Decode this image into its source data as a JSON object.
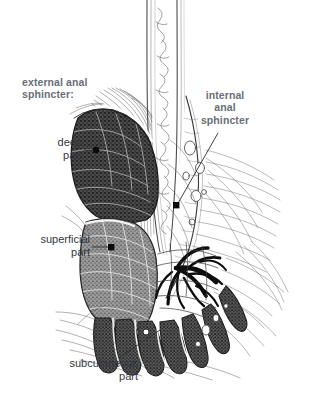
{
  "figure": {
    "background_color": "#ffffff",
    "label_heading_color": "#6b6f78",
    "label_part_color": "#333740",
    "ink_color": "#2b2b2b"
  },
  "labels": {
    "external_anal_sphincter": "external anal\nsphincter:",
    "internal_anal_sphincter": "internal\nanal\nsphincter",
    "deep_part": "deep\npart",
    "superficial_part": "superficial\npart",
    "subcutaneous_part": "subcutaneous\npart"
  },
  "structures": [
    {
      "name": "deep-part-mass",
      "label": "deep part",
      "fill": "#4a4a4a"
    },
    {
      "name": "superficial-part-mass",
      "label": "superficial part",
      "fill": "#8a8a8a"
    },
    {
      "name": "subcutaneous-part-segments",
      "label": "subcutaneous part",
      "fill": "#4f4f4f",
      "count": 7
    },
    {
      "name": "internal-anal-sphincter-band",
      "label": "internal anal sphincter",
      "fill": "#ffffff"
    },
    {
      "name": "hemorrhoidal-plexus",
      "label": "venous plexus",
      "fill": "#111111"
    },
    {
      "name": "rectal-mucosa-column",
      "label": "rectal mucosa",
      "fill": "#ffffff"
    },
    {
      "name": "levator-ani-fibers",
      "label": "levator ani",
      "fill": "none"
    },
    {
      "name": "perianal-tissue-hatching",
      "label": "perianal tissue",
      "fill": "none"
    }
  ],
  "markers": [
    {
      "name": "deep-part-marker",
      "shape": "circle",
      "x": 95,
      "y": 151
    },
    {
      "name": "superficial-part-marker",
      "shape": "square",
      "x": 111,
      "y": 248
    },
    {
      "name": "internal-sphincter-marker",
      "shape": "square",
      "x": 176,
      "y": 205
    },
    {
      "name": "subcutaneous-part-marker",
      "shape": "circle-open",
      "x": 146,
      "y": 332
    }
  ]
}
